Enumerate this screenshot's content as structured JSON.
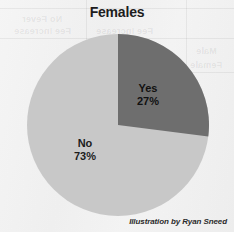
{
  "chart_data": {
    "type": "pie",
    "title": "Females",
    "categories": [
      "Yes",
      "No"
    ],
    "values": [
      27,
      73
    ],
    "unit": "percent",
    "slices": [
      {
        "label": "Yes",
        "value": 27,
        "value_label": "27%",
        "color": "#6e6e6e",
        "start_angle_deg": 0,
        "sweep_deg": 97.2
      },
      {
        "label": "No",
        "value": 73,
        "value_label": "73%",
        "color": "#c8c8c8",
        "start_angle_deg": 97.2,
        "sweep_deg": 262.8
      }
    ],
    "legend": "none",
    "grid": false,
    "xlabel": "",
    "ylabel": ""
  },
  "header": {
    "title": "Females"
  },
  "labels": {
    "yes_name": "Yes",
    "yes_pct": "27%",
    "no_name": "No",
    "no_pct": "73%"
  },
  "colors": {
    "yes_slice": "#6e6e6e",
    "no_slice": "#c8c8c8",
    "paper": "#f4f4f4",
    "title_text": "#1d1d1d"
  },
  "credit": {
    "text": "Illustration by Ryan Sneed"
  },
  "background_bleed": {
    "items": [
      {
        "text": "No Fever",
        "x": 22,
        "y": 14
      },
      {
        "text": "Fee Increase",
        "x": 14,
        "y": 26
      },
      {
        "text": "Fee Increase",
        "x": 96,
        "y": 26
      },
      {
        "text": "Male",
        "x": 196,
        "y": 46
      },
      {
        "text": "Female",
        "x": 190,
        "y": 60
      },
      {
        "text": "100",
        "x": 62,
        "y": 50
      },
      {
        "text": "All Students",
        "x": 84,
        "y": 176
      }
    ]
  }
}
